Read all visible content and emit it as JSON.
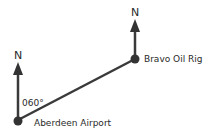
{
  "diagram": {
    "type": "bearing-diagram",
    "points": [
      {
        "id": "aberdeen",
        "label": "Aberdeen Airport"
      },
      {
        "id": "bravo",
        "label": "Bravo Oil Rig"
      }
    ],
    "north_labels": [
      "N",
      "N"
    ],
    "bearing_label": "060°",
    "colors": {
      "line": "#3a3a3a",
      "dot": "#333333",
      "text": "#2a2a2a"
    }
  }
}
